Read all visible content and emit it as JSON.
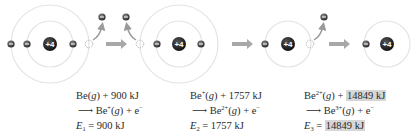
{
  "diagram": {
    "nucleus_charge": "+4",
    "electron_glyph": "−",
    "colors": {
      "nucleus": "#1a1a1a",
      "electron": "#333333",
      "shell": "#e4e4e4",
      "arrow": "#9a9a9a",
      "highlight": "#d6d6d6"
    },
    "stages": [
      {
        "id": "Be",
        "shells": 2,
        "inner_electrons": 2,
        "outer_electrons_remaining": 1,
        "removed": 1
      },
      {
        "id": "Be+",
        "shells": 2,
        "inner_electrons": 2,
        "outer_electrons_remaining": 0,
        "removed": 1
      },
      {
        "id": "Be2+",
        "shells": 1,
        "inner_electrons": 1,
        "outer_electrons_remaining": 0,
        "removed": 1
      },
      {
        "id": "Be3+",
        "shells": 1,
        "inner_electrons": 1,
        "outer_electrons_remaining": 0,
        "removed": 0
      }
    ]
  },
  "equations": [
    {
      "reactant": "Be",
      "reactant_charge": "",
      "state": "g",
      "energy": "900 kJ",
      "product": "Be",
      "product_charge": "+",
      "electron": "e",
      "electron_charge": "−",
      "label": "E",
      "label_sub": "1",
      "value": "900 kJ",
      "highlighted": false
    },
    {
      "reactant": "Be",
      "reactant_charge": "+",
      "state": "g",
      "energy": "1757 kJ",
      "product": "Be",
      "product_charge": "2+",
      "electron": "e",
      "electron_charge": "−",
      "label": "E",
      "label_sub": "2",
      "value": "1757 kJ",
      "highlighted": false
    },
    {
      "reactant": "Be",
      "reactant_charge": "2+",
      "state": "g",
      "energy": "14849 kJ",
      "product": "Be",
      "product_charge": "3+",
      "electron": "e",
      "electron_charge": "−",
      "label": "E",
      "label_sub": "3",
      "value": "14849 kJ",
      "highlighted": true
    }
  ]
}
